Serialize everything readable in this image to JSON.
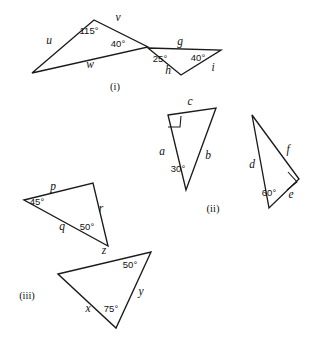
{
  "figure": {
    "width": 322,
    "height": 343,
    "stroke_color": "#1b1b1b",
    "background_color": "#ffffff",
    "degree_symbol": "°"
  },
  "groups": [
    {
      "id": "group-i",
      "caption": "(i)",
      "caption_x": 115,
      "caption_y": 90,
      "triangles": [
        {
          "id": "i-left",
          "points": "32,73 94,20 148,47",
          "sides": [
            {
              "label": "u",
              "x": 49,
              "y": 44
            },
            {
              "label": "v",
              "x": 118,
              "y": 21
            },
            {
              "label": "w",
              "x": 90,
              "y": 68
            }
          ],
          "angles": [
            {
              "label": "115",
              "x": 89,
              "y": 34
            },
            {
              "label": "40",
              "x": 118,
              "y": 47
            }
          ],
          "right_angles": []
        },
        {
          "id": "i-right",
          "points": "148,48 221,50 181,75",
          "sides": [
            {
              "label": "g",
              "x": 180,
              "y": 45
            },
            {
              "label": "h",
              "x": 168,
              "y": 74
            },
            {
              "label": "i",
              "x": 213,
              "y": 71
            }
          ],
          "angles": [
            {
              "label": "25",
              "x": 160,
              "y": 62
            },
            {
              "label": "40",
              "x": 198,
              "y": 61
            }
          ],
          "right_angles": []
        }
      ]
    },
    {
      "id": "group-ii",
      "caption": "(ii)",
      "caption_x": 213,
      "caption_y": 212,
      "triangles": [
        {
          "id": "ii-left",
          "points": "168,115 216,108 186,190",
          "sides": [
            {
              "label": "c",
              "x": 190,
              "y": 105
            },
            {
              "label": "a",
              "x": 162,
              "y": 155
            },
            {
              "label": "b",
              "x": 208,
              "y": 159
            }
          ],
          "angles": [
            {
              "label": "30",
              "x": 178,
              "y": 172
            }
          ],
          "right_angles": [
            {
              "points": "168,127 180,127 181,116"
            }
          ]
        },
        {
          "id": "ii-right",
          "points": "252,115 299,179 269,208",
          "sides": [
            {
              "label": "f",
              "x": 288,
              "y": 153
            },
            {
              "label": "d",
              "x": 252,
              "y": 168
            },
            {
              "label": "e",
              "x": 291,
              "y": 198
            }
          ],
          "angles": [
            {
              "label": "60",
              "x": 269,
              "y": 196
            }
          ],
          "right_angles": [
            {
              "points": "288,172 297,182 287,190"
            }
          ]
        }
      ]
    },
    {
      "id": "group-iii",
      "caption": "(iii)",
      "caption_x": 27,
      "caption_y": 299,
      "triangles": [
        {
          "id": "iii-top",
          "points": "24,200 93,183 108,246",
          "sides": [
            {
              "label": "p",
              "x": 53,
              "y": 190
            },
            {
              "label": "q",
              "x": 62,
              "y": 230
            },
            {
              "label": "r",
              "x": 101,
              "y": 212
            }
          ],
          "angles": [
            {
              "label": "45",
              "x": 37,
              "y": 205
            },
            {
              "label": "50",
              "x": 87,
              "y": 230
            }
          ],
          "right_angles": []
        },
        {
          "id": "iii-bottom",
          "points": "58,274 151,252 116,328",
          "sides": [
            {
              "label": "z",
              "x": 104,
              "y": 254
            },
            {
              "label": "x",
              "x": 88,
              "y": 312
            },
            {
              "label": "y",
              "x": 141,
              "y": 295
            }
          ],
          "angles": [
            {
              "label": "50",
              "x": 130,
              "y": 268
            },
            {
              "label": "75",
              "x": 111,
              "y": 312
            }
          ],
          "right_angles": []
        }
      ]
    }
  ]
}
